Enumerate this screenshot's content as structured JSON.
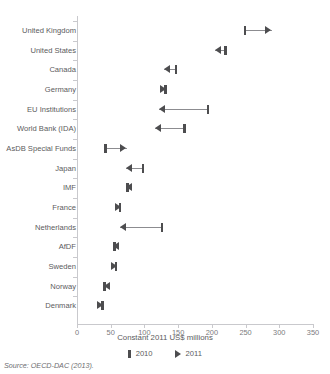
{
  "source_note": "Source: OECD-DAC (2013).",
  "legend": [
    {
      "label": "2010",
      "marker": "bar-marker"
    },
    {
      "label": "2011",
      "marker": "triangle-marker"
    }
  ],
  "chart_data": {
    "type": "scatter",
    "title": "",
    "subtitle": "",
    "xlabel": "Constant 2011 US$ millions",
    "ylabel": "",
    "xlim": [
      0,
      350
    ],
    "ylim": [
      0,
      15
    ],
    "xticks": [
      0,
      50,
      100,
      150,
      200,
      250,
      300,
      350
    ],
    "grid": false,
    "legend_position": "bottom-center",
    "categories": [
      "United Kingdom",
      "United States",
      "Canada",
      "Germany",
      "EU Institutions",
      "World Bank (IDA)",
      "AsDB Special Funds",
      "Japan",
      "IMF",
      "France",
      "Netherlands",
      "AfDF",
      "Sweden",
      "Norway",
      "Denmark"
    ],
    "series": [
      {
        "name": "2010",
        "marker": "bar",
        "values": [
          249,
          220,
          147,
          131,
          194,
          159,
          42,
          98,
          75,
          64,
          126,
          56,
          58,
          41,
          38
        ]
      },
      {
        "name": "2011",
        "marker": "arrow",
        "values": [
          289,
          205,
          129,
          133,
          122,
          116,
          74,
          73,
          73,
          66,
          64,
          54,
          60,
          40,
          39
        ]
      }
    ],
    "annotations": [
      "Arrow direction indicates change from 2010 to 2011",
      "Right-pointing arrow = increase, left-pointing arrow = decrease"
    ]
  }
}
